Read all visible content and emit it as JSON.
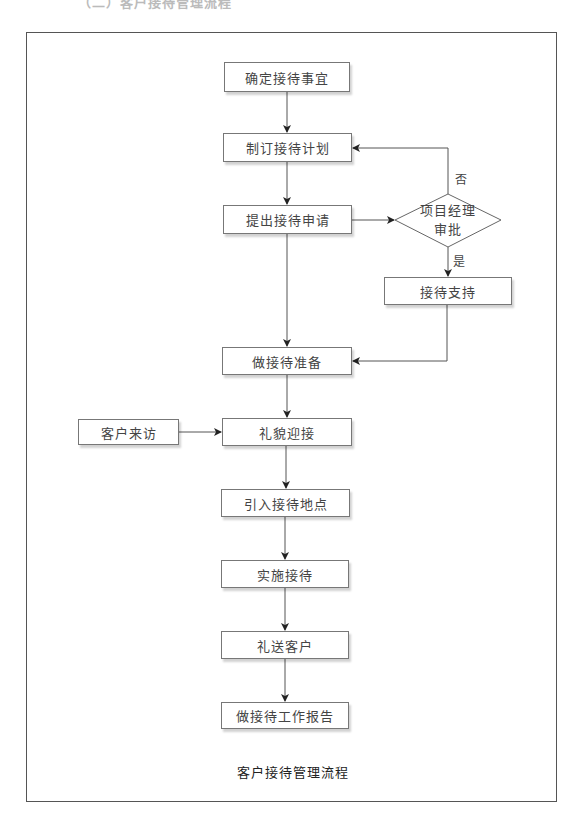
{
  "header": {
    "clipped_title": "（二）客户接待管理流程"
  },
  "diagram": {
    "type": "flowchart",
    "title": "客户接待管理流程",
    "nodes": {
      "confirm": "确定接待事宜",
      "plan": "制订接待计划",
      "apply": "提出接待申请",
      "approve": {
        "line1": "项目经理",
        "line2": "审批"
      },
      "support": "接待支持",
      "prepare": "做接待准备",
      "visit": "客户来访",
      "greet": "礼貌迎接",
      "guide": "引入接待地点",
      "implement": "实施接待",
      "sendoff": "礼送客户",
      "report": "做接待工作报告"
    },
    "edge_labels": {
      "no": "否",
      "yes": "是"
    },
    "edges": [
      [
        "确定接待事宜",
        "制订接待计划"
      ],
      [
        "制订接待计划",
        "提出接待申请"
      ],
      [
        "提出接待申请",
        "项目经理审批"
      ],
      [
        "项目经理审批",
        "制订接待计划",
        "否"
      ],
      [
        "项目经理审批",
        "接待支持",
        "是"
      ],
      [
        "提出接待申请",
        "做接待准备"
      ],
      [
        "接待支持",
        "做接待准备"
      ],
      [
        "做接待准备",
        "礼貌迎接"
      ],
      [
        "客户来访",
        "礼貌迎接"
      ],
      [
        "礼貌迎接",
        "引入接待地点"
      ],
      [
        "引入接待地点",
        "实施接待"
      ],
      [
        "实施接待",
        "礼送客户"
      ],
      [
        "礼送客户",
        "做接待工作报告"
      ]
    ],
    "colors": {
      "line": "#444444",
      "box_border": "#777777",
      "text": "#444444"
    }
  }
}
